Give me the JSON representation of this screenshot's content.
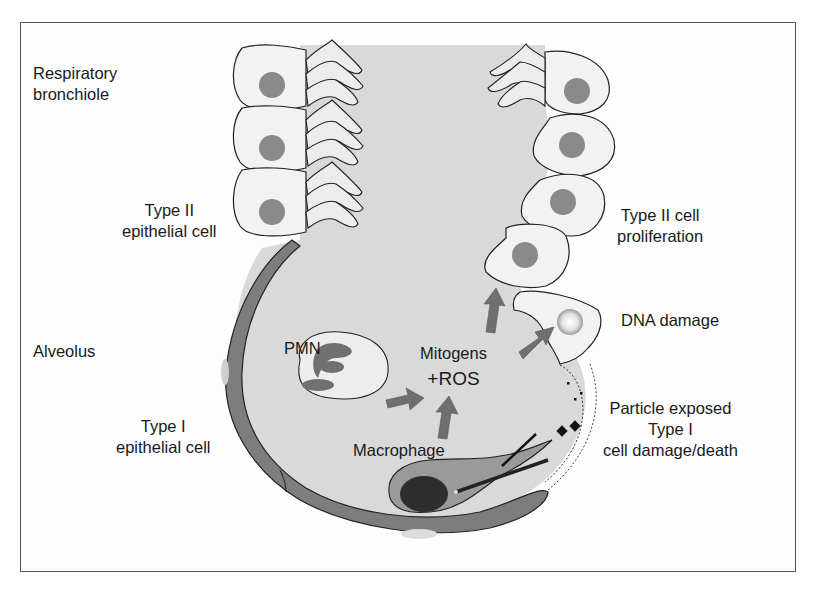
{
  "diagram": {
    "type": "biological-illustration",
    "colors": {
      "lumen": "#d9d9d9",
      "cell_fill": "#f2f2f2",
      "nucleus": "#8a8a8a",
      "type1_cell": "#7d7d7d",
      "arrow": "#6f6f6f",
      "macrophage_body": "#9a9a9a",
      "macrophage_nucleus": "#2e2e2e",
      "outline": "#222222",
      "frame": "#555555"
    },
    "labels": {
      "respiratory_bronchiole": [
        "Respiratory",
        "bronchiole"
      ],
      "type2_epithelial_cell": [
        "Type II",
        "epithelial cell"
      ],
      "alveolus": [
        "Alveolus"
      ],
      "type1_epithelial_cell": [
        "Type I",
        "epithelial cell"
      ],
      "pmn": [
        "PMN"
      ],
      "mitogens_ros": [
        "Mitogens",
        "+ROS"
      ],
      "macrophage": [
        "Macrophage"
      ],
      "type2_cell_proliferation": [
        "Type II cell",
        "proliferation"
      ],
      "dna_damage": [
        "DNA damage"
      ],
      "particle_exposed": [
        "Particle exposed",
        "Type I",
        "cell damage/death"
      ]
    },
    "arrows": [
      {
        "from": "PMN",
        "to": "Mitogens +ROS"
      },
      {
        "from": "Macrophage",
        "to": "Mitogens +ROS"
      },
      {
        "from": "Mitogens +ROS",
        "to": "Type II cell proliferation"
      },
      {
        "from": "Mitogens +ROS",
        "to": "DNA damage"
      }
    ]
  }
}
